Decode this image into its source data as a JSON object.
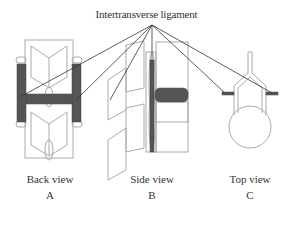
{
  "title": "Intertransverse ligament",
  "views": [
    {
      "name": "Back view",
      "letter": "A"
    },
    {
      "name": "Side view",
      "letter": "B"
    },
    {
      "name": "Top view",
      "letter": "C"
    }
  ],
  "colors": {
    "ligament": "#555555",
    "outline": "#aaaaaa",
    "leader": "#333333"
  }
}
